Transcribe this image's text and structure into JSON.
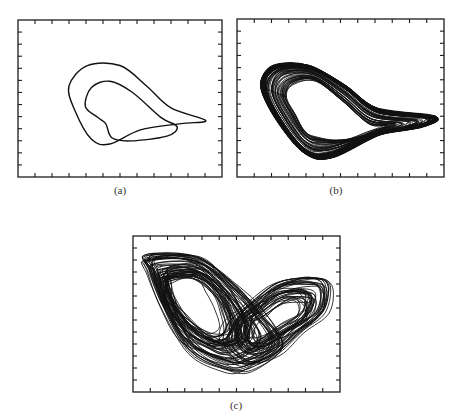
{
  "chart_data": [
    {
      "type": "line",
      "id": "a",
      "caption": "(a)",
      "title": "",
      "xlabel": "",
      "ylabel": "",
      "description": "Phase portrait: period-2 limit cycle (two nested closed loops)",
      "grid": false,
      "legend": "none",
      "x_ticks": 12,
      "y_ticks": 13,
      "tick_labels": false,
      "curve_kind": "period2",
      "loops": 2
    },
    {
      "type": "line",
      "id": "b",
      "caption": "(b)",
      "title": "",
      "xlabel": "",
      "ylabel": "",
      "description": "Phase portrait: banded (single-scroll) chaotic attractor",
      "grid": false,
      "legend": "none",
      "x_ticks": 12,
      "y_ticks": 13,
      "tick_labels": false,
      "curve_kind": "banded",
      "loops": 60
    },
    {
      "type": "line",
      "id": "c",
      "caption": "(c)",
      "title": "",
      "xlabel": "",
      "ylabel": "",
      "description": "Phase portrait: double-scroll (butterfly) chaotic attractor",
      "grid": false,
      "legend": "none",
      "x_ticks": 12,
      "y_ticks": 13,
      "tick_labels": false,
      "curve_kind": "double-scroll",
      "loops": 90
    }
  ]
}
